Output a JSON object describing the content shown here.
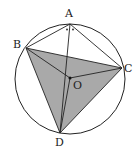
{
  "diagram": {
    "type": "geometry-circle",
    "circle": {
      "center": "O",
      "cx": 70,
      "cy": 79,
      "r": 55
    },
    "points": [
      {
        "name": "A",
        "x": 70,
        "y": 24,
        "label": "A",
        "lx": 65,
        "ly": 17
      },
      {
        "name": "B",
        "x": 26,
        "y": 48,
        "label": "B",
        "lx": 13,
        "ly": 48
      },
      {
        "name": "C",
        "x": 122,
        "y": 68,
        "label": "C",
        "lx": 125,
        "ly": 71
      },
      {
        "name": "D",
        "x": 60,
        "y": 133,
        "label": "D",
        "lx": 55,
        "ly": 146
      },
      {
        "name": "O",
        "x": 70,
        "y": 78,
        "label": "O",
        "lx": 73,
        "ly": 89
      }
    ],
    "shaded_triangle": [
      "B",
      "C",
      "D"
    ],
    "segments": [
      [
        "A",
        "B"
      ],
      [
        "A",
        "C"
      ],
      [
        "A",
        "D"
      ],
      [
        "B",
        "C"
      ],
      [
        "B",
        "D"
      ],
      [
        "C",
        "D"
      ],
      [
        "B",
        "O"
      ],
      [
        "O",
        "C"
      ],
      [
        "O",
        "D"
      ]
    ],
    "angle_marks": {
      "at": "A",
      "type": "equal-angle-dots",
      "count": 2
    },
    "colors": {
      "shade": "#a9a9a9",
      "stroke": "#222222",
      "background": "#ffffff"
    }
  }
}
